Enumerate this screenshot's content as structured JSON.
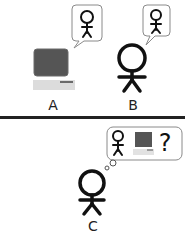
{
  "diagram": {
    "top_panel": {
      "entities": [
        {
          "id": "A",
          "label": "A",
          "kind": "computer",
          "thought": "person-icon"
        },
        {
          "id": "B",
          "label": "B",
          "kind": "person",
          "thought": "person-icon"
        }
      ]
    },
    "bottom_panel": {
      "entities": [
        {
          "id": "C",
          "label": "C",
          "kind": "person",
          "thought": [
            "person-icon",
            "computer-icon",
            "question-mark"
          ],
          "question": "?"
        }
      ]
    },
    "colors": {
      "stroke": "#111111",
      "bubble_border": "#8a8a8a",
      "monitor": "#555555",
      "keyboard": "#dcdcdc",
      "divider": "#222222"
    }
  }
}
